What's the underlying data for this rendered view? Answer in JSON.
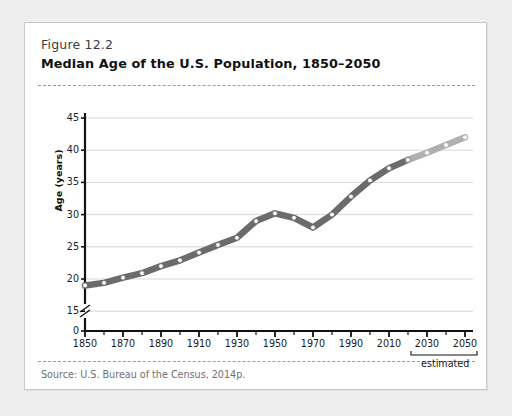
{
  "figure": {
    "number": "Figure 12.2",
    "title": "Median Age of the U.S. Population, 1850–2050",
    "source": "Source: U.S. Bureau of the Census, 2014p."
  },
  "colors": {
    "page_background": "#eeeeee",
    "card_background": "#ffffff",
    "card_border": "#c9c9c9",
    "line_actual": "#6b6b6b",
    "line_estimated": "#b0b0b0",
    "gridline": "#d8d8d8",
    "axis": "#111111",
    "marker_fill": "#ffffff",
    "rule_dashed": "#9a9a9a",
    "source_text": "#6f6f6f"
  },
  "chart_data": {
    "type": "line",
    "title": "Median Age of the U.S. Population, 1850–2050",
    "xlabel": "",
    "ylabel": "Age (years)",
    "xlim": [
      1850,
      2050
    ],
    "ylim": [
      15,
      45
    ],
    "y_axis_break": true,
    "y_break_between": [
      0,
      15
    ],
    "grid": true,
    "legend": "none",
    "ytick_labels": [
      "0",
      "15",
      "20",
      "25",
      "30",
      "35",
      "40",
      "45"
    ],
    "ytick_values": [
      0,
      15,
      20,
      25,
      30,
      35,
      40,
      45
    ],
    "xtick_labels": [
      "1850",
      "1870",
      "1890",
      "1910",
      "1930",
      "1950",
      "1970",
      "1990",
      "2010",
      "2030",
      "2050"
    ],
    "xtick_values": [
      1850,
      1870,
      1890,
      1910,
      1930,
      1950,
      1970,
      1990,
      2010,
      2030,
      2050
    ],
    "x_minor_step": 10,
    "annotation": {
      "text": "estimated",
      "bracket_from": 2030,
      "bracket_to": 2050
    },
    "series": [
      {
        "name": "Median age",
        "x": [
          1850,
          1860,
          1870,
          1880,
          1890,
          1900,
          1910,
          1920,
          1930,
          1940,
          1950,
          1960,
          1970,
          1980,
          1990,
          2000,
          2010,
          2020,
          2030,
          2040,
          2050
        ],
        "values": [
          19.0,
          19.4,
          20.2,
          20.9,
          22.0,
          22.9,
          24.1,
          25.3,
          26.4,
          29.0,
          30.2,
          29.5,
          28.0,
          30.0,
          32.8,
          35.3,
          37.2,
          38.5,
          39.6,
          40.8,
          42.0
        ],
        "segments": [
          {
            "label": "actual",
            "x_from": 1850,
            "x_to": 2020,
            "color": "#6b6b6b"
          },
          {
            "label": "estimated",
            "x_from": 2020,
            "x_to": 2050,
            "color": "#b0b0b0"
          }
        ]
      }
    ]
  }
}
